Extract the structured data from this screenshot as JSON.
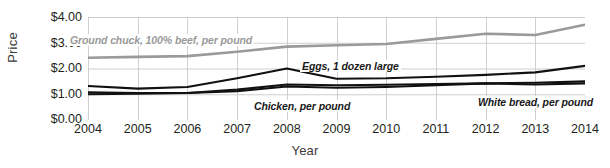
{
  "chart_data": {
    "type": "line",
    "title": "",
    "xlabel": "Year",
    "ylabel": "Price",
    "grid": true,
    "legend_position": "inline-labels",
    "x": [
      2004,
      2005,
      2006,
      2007,
      2008,
      2009,
      2010,
      2011,
      2012,
      2013,
      2014
    ],
    "xtick_labels": [
      "2004",
      "2005",
      "2006",
      "2007",
      "2008",
      "2009",
      "2010",
      "2011",
      "2012",
      "2013",
      "2014"
    ],
    "ytick_labels": [
      "$0.00",
      "$1.00",
      "$2.00",
      "$3.00",
      "$4.00"
    ],
    "ytick_values": [
      0,
      1,
      2,
      3,
      4
    ],
    "ylim": [
      0,
      4
    ],
    "xlim": [
      2004,
      2014
    ],
    "series": [
      {
        "name": "Ground chuck, 100% beef, per pound",
        "color": "#9a9a9a",
        "values": [
          2.42,
          2.45,
          2.48,
          2.65,
          2.85,
          2.9,
          2.95,
          3.15,
          3.35,
          3.3,
          3.7
        ]
      },
      {
        "name": "Eggs, 1 dozen large",
        "color": "#111111",
        "values": [
          1.32,
          1.22,
          1.28,
          1.62,
          2.0,
          1.6,
          1.62,
          1.68,
          1.75,
          1.85,
          2.1
        ]
      },
      {
        "name": "Chicken, per pound",
        "color": "#111111",
        "values": [
          1.07,
          1.05,
          1.05,
          1.12,
          1.3,
          1.25,
          1.28,
          1.35,
          1.42,
          1.45,
          1.5
        ]
      },
      {
        "name": "White bread, per pound",
        "color": "#111111",
        "values": [
          1.0,
          1.02,
          1.05,
          1.18,
          1.38,
          1.35,
          1.37,
          1.4,
          1.42,
          1.38,
          1.42
        ]
      }
    ],
    "series_labels": [
      {
        "text": "Ground chuck, 100% beef, per pound",
        "tone": "gray"
      },
      {
        "text": "Eggs, 1 dozen large",
        "tone": "dark"
      },
      {
        "text": "Chicken, per pound",
        "tone": "dark"
      },
      {
        "text": "White bread, per pound",
        "tone": "dark"
      }
    ],
    "colors": {
      "ground_chuck": "#9a9a9a",
      "eggs": "#111111",
      "chicken": "#111111",
      "white_bread": "#111111",
      "grid": "#c9c9c9",
      "axis_text": "#231f20"
    }
  }
}
